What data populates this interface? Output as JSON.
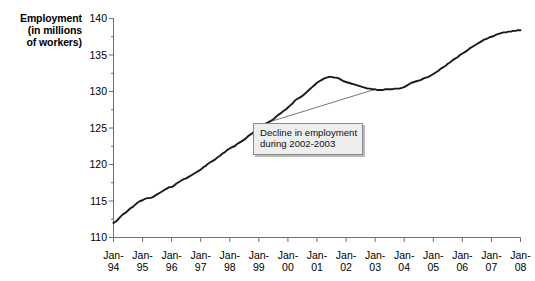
{
  "chart_data": {
    "type": "line",
    "title": "",
    "ylabel": "Employment\n(in millions\nof workers)",
    "xlabel": "",
    "ylim": [
      110,
      140
    ],
    "ytick_labels": [
      "110",
      "115",
      "120",
      "125",
      "130",
      "135",
      "140"
    ],
    "ytick_values": [
      110,
      115,
      120,
      125,
      130,
      135,
      140
    ],
    "ytick_minor_step": 2.5,
    "xtick_labels": [
      {
        "line1": "Jan-",
        "line2": "94"
      },
      {
        "line1": "Jan-",
        "line2": "95"
      },
      {
        "line1": "Jan-",
        "line2": "96"
      },
      {
        "line1": "Jan-",
        "line2": "97"
      },
      {
        "line1": "Jan-",
        "line2": "98"
      },
      {
        "line1": "Jan-",
        "line2": "99"
      },
      {
        "line1": "Jan-",
        "line2": "00"
      },
      {
        "line1": "Jan-",
        "line2": "01"
      },
      {
        "line1": "Jan-",
        "line2": "02"
      },
      {
        "line1": "Jan-",
        "line2": "03"
      },
      {
        "line1": "Jan-",
        "line2": "04"
      },
      {
        "line1": "Jan-",
        "line2": "05"
      },
      {
        "line1": "Jan-",
        "line2": "06"
      },
      {
        "line1": "Jan-",
        "line2": "07"
      },
      {
        "line1": "Jan-",
        "line2": "08"
      }
    ],
    "xlim": [
      "Jan-94",
      "Jan-08"
    ],
    "grid": false,
    "legend": null,
    "line_color": "#1a1a1a",
    "annotations": [
      {
        "text": "Decline in employment\nduring 2002-2003",
        "target_x": "Jan-03",
        "target_y": 130.3
      }
    ],
    "x_years": [
      1994,
      1995,
      1996,
      1997,
      1998,
      1999,
      2000,
      2001,
      2002,
      2003,
      2004,
      2005,
      2006,
      2007,
      2008
    ],
    "series": [
      {
        "name": "Employment",
        "units": "millions of workers",
        "x_monthly_start": "1994-01",
        "values": [
          112.0,
          112.2,
          112.5,
          112.9,
          113.2,
          113.4,
          113.7,
          114.0,
          114.2,
          114.5,
          114.8,
          115.0,
          115.1,
          115.3,
          115.4,
          115.4,
          115.5,
          115.7,
          115.9,
          116.1,
          116.3,
          116.5,
          116.7,
          116.9,
          116.9,
          117.1,
          117.4,
          117.6,
          117.8,
          118.0,
          118.1,
          118.3,
          118.5,
          118.7,
          118.9,
          119.1,
          119.3,
          119.6,
          119.8,
          120.1,
          120.3,
          120.5,
          120.7,
          121.0,
          121.2,
          121.5,
          121.7,
          122.0,
          122.2,
          122.4,
          122.5,
          122.8,
          123.0,
          123.2,
          123.4,
          123.7,
          124.0,
          124.2,
          124.5,
          124.7,
          124.9,
          125.1,
          125.4,
          125.6,
          125.8,
          126.0,
          126.2,
          126.5,
          126.8,
          127.0,
          127.3,
          127.5,
          127.8,
          128.1,
          128.4,
          128.8,
          129.0,
          129.2,
          129.4,
          129.7,
          130.0,
          130.3,
          130.6,
          130.9,
          131.2,
          131.4,
          131.6,
          131.8,
          131.9,
          132.0,
          132.0,
          131.9,
          131.9,
          131.8,
          131.6,
          131.4,
          131.3,
          131.2,
          131.1,
          131.0,
          130.9,
          130.8,
          130.7,
          130.6,
          130.5,
          130.4,
          130.4,
          130.3,
          130.3,
          130.2,
          130.2,
          130.2,
          130.3,
          130.3,
          130.3,
          130.3,
          130.4,
          130.4,
          130.4,
          130.5,
          130.6,
          130.8,
          131.0,
          131.2,
          131.3,
          131.4,
          131.5,
          131.6,
          131.8,
          131.9,
          132.0,
          132.2,
          132.4,
          132.6,
          132.8,
          133.1,
          133.3,
          133.5,
          133.8,
          134.0,
          134.3,
          134.5,
          134.7,
          135.0,
          135.2,
          135.4,
          135.6,
          135.9,
          136.1,
          136.3,
          136.5,
          136.7,
          136.9,
          137.1,
          137.2,
          137.4,
          137.5,
          137.6,
          137.8,
          137.9,
          138.0,
          138.1,
          138.1,
          138.2,
          138.2,
          138.3,
          138.3,
          138.4,
          138.4
        ]
      }
    ]
  }
}
